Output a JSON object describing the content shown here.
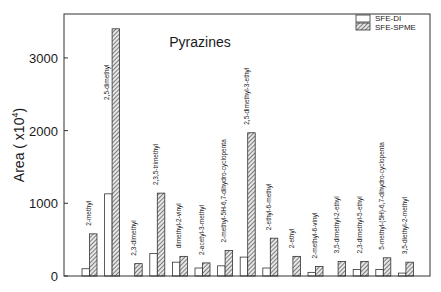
{
  "chart_data": {
    "type": "bar",
    "title": "Pyrazines",
    "xlabel": "",
    "ylabel": "Area ( x10",
    "ylabel_superscript": "4",
    "ylabel_suffix": ")",
    "ylim": [
      0,
      3500
    ],
    "yticks": [
      0,
      1000,
      2000,
      3000
    ],
    "ytick_labels": [
      "0",
      "1000",
      "2000",
      "3000"
    ],
    "grid": false,
    "legend_position": "top-right",
    "categories": [
      "2-methyl",
      "2,5-dimethyl",
      "2,3-dimethyl",
      "2,3,5-trimethyl",
      "dimethyl-2-vinyl",
      "2-acetyl-3-methyl",
      "2-methyl-5H-6,7-dihydro-cyclopenta",
      "2,5-dimethyl-3-ethyl",
      "2-ethyl-6-methyl",
      "2-ethyl",
      "2-methyl-6-vinyl",
      "3,5-dimethyl-2-ethyl",
      "2,3-dimethyl-5-ethyl",
      "5-methyl-(5H)-6,7-dihydro-cyclopenta",
      "3,5-diethyl-2-methyl"
    ],
    "series": [
      {
        "name": "SFE-DI",
        "pattern": "open",
        "values": [
          100,
          1130,
          0,
          310,
          190,
          110,
          140,
          260,
          110,
          0,
          50,
          0,
          90,
          90,
          40
        ]
      },
      {
        "name": "SFE-SPME",
        "pattern": "hatched",
        "values": [
          580,
          3400,
          170,
          1140,
          270,
          180,
          350,
          1970,
          520,
          270,
          130,
          200,
          200,
          250,
          190
        ]
      }
    ]
  },
  "colors": {
    "axis": "#333333",
    "bar_outline": "#333333",
    "open_fill": "#ffffff",
    "hatch_bg": "#e6e6e6",
    "hatch_line": "#444444"
  }
}
